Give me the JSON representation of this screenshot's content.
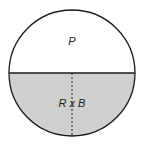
{
  "diagram": {
    "top_label": "P",
    "bottom_label": "R x B",
    "colors": {
      "top_fill": "#ffffff",
      "bottom_fill": "#cfcfcf",
      "stroke": "#1a1a1a"
    }
  }
}
